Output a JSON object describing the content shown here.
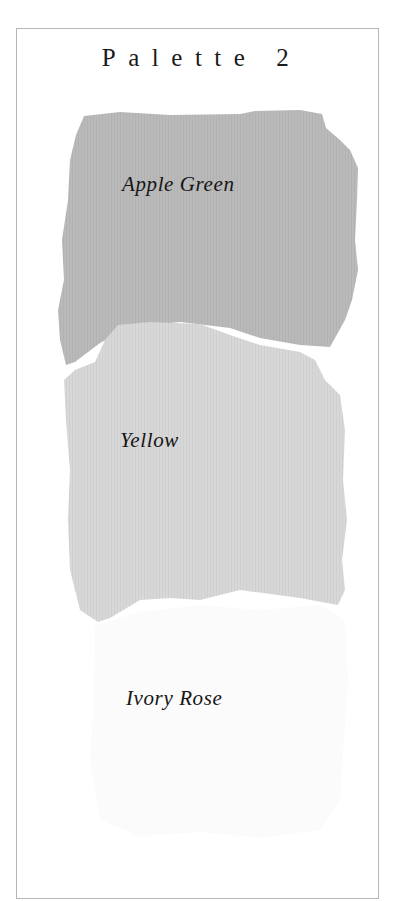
{
  "title": "Palette 2",
  "swatches": [
    {
      "name": "Apple Green",
      "fill": "#bababa"
    },
    {
      "name": "Yellow",
      "fill": "#d6d6d6"
    },
    {
      "name": "Ivory Rose",
      "fill": "#fbfbfb"
    }
  ],
  "colors": {
    "border": "#b5b5b5",
    "text": "#151515",
    "background": "#ffffff"
  }
}
